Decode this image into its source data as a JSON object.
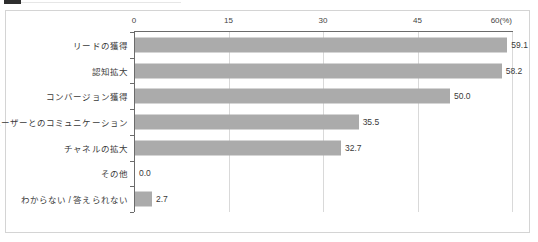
{
  "figure": {
    "marker_name": "section-bullet-marker",
    "frame_visible": true
  },
  "chart_data": {
    "type": "bar",
    "orientation": "horizontal",
    "title": "",
    "subtitle": "",
    "xlabel": "",
    "ylabel": "",
    "unit_label": "(%)",
    "xlim": [
      0,
      60
    ],
    "xticks": [
      0,
      15,
      30,
      45,
      60
    ],
    "xtick_labels": [
      "0",
      "15",
      "30",
      "45",
      "60"
    ],
    "grid": true,
    "legend": "none",
    "bar_color": "#ababab",
    "axis_color": "#6b6b6b",
    "grid_color": "#d9d9d9",
    "categories": [
      "リードの獲得",
      "認知拡大",
      "コンバージョン獲得",
      "ユーザーとのコミュニケーション",
      "チャネルの拡大",
      "その他",
      "わからない / 答えられない"
    ],
    "values": [
      59.1,
      58.2,
      50.0,
      35.5,
      32.7,
      0.0,
      2.7
    ],
    "value_labels": [
      "59.1",
      "58.2",
      "50.0",
      "35.5",
      "32.7",
      "0.0",
      "2.7"
    ]
  }
}
